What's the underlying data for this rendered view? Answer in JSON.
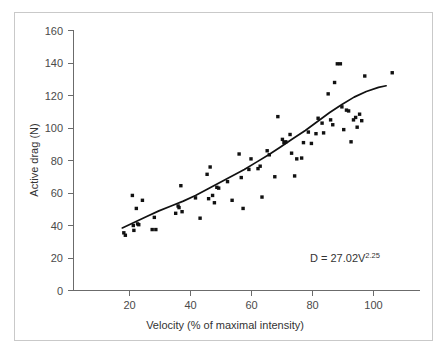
{
  "chart_data": {
    "type": "scatter",
    "title": "",
    "xlabel": "Velocity (% of maximal intensity)",
    "ylabel": "Active drag (N)",
    "xlim": [
      0,
      114
    ],
    "ylim": [
      0,
      160
    ],
    "xticks": [
      20,
      40,
      60,
      80,
      100
    ],
    "yticks": [
      0,
      20,
      40,
      60,
      80,
      100,
      120,
      140,
      160
    ],
    "grid": false,
    "legend": null,
    "annotations": [
      {
        "name": "regression-equation",
        "text_base": "D = 27.02V",
        "text_exponent": "2.25",
        "full_text": "D = 27.02V^2.25",
        "x": 82,
        "y": 20
      }
    ],
    "series": [
      {
        "name": "active-drag-measurements",
        "marker": "square",
        "color": "#111111",
        "points": [
          [
            16.5,
            35.5
          ],
          [
            17.0,
            34.0
          ],
          [
            19.3,
            58.5
          ],
          [
            19.6,
            40.0
          ],
          [
            19.8,
            37.0
          ],
          [
            20.6,
            50.5
          ],
          [
            21.0,
            41.0
          ],
          [
            21.4,
            40.5
          ],
          [
            22.6,
            55.5
          ],
          [
            25.8,
            37.5
          ],
          [
            26.5,
            45.0
          ],
          [
            27.0,
            37.5
          ],
          [
            33.5,
            47.5
          ],
          [
            34.3,
            52.0
          ],
          [
            34.6,
            51.0
          ],
          [
            35.2,
            64.5
          ],
          [
            35.6,
            48.5
          ],
          [
            40.0,
            57.0
          ],
          [
            41.5,
            44.5
          ],
          [
            43.8,
            71.5
          ],
          [
            44.3,
            56.5
          ],
          [
            44.8,
            76.0
          ],
          [
            45.6,
            58.5
          ],
          [
            46.2,
            54.0
          ],
          [
            47.0,
            63.5
          ],
          [
            47.6,
            63.0
          ],
          [
            50.5,
            67.0
          ],
          [
            52.0,
            55.5
          ],
          [
            54.3,
            84.0
          ],
          [
            55.0,
            69.5
          ],
          [
            55.6,
            50.5
          ],
          [
            57.5,
            74.5
          ],
          [
            58.2,
            81.0
          ],
          [
            60.5,
            75.0
          ],
          [
            61.2,
            76.5
          ],
          [
            61.8,
            57.5
          ],
          [
            63.5,
            86.0
          ],
          [
            64.2,
            83.5
          ],
          [
            66.0,
            70.0
          ],
          [
            67.0,
            107.0
          ],
          [
            68.5,
            93.0
          ],
          [
            69.0,
            91.0
          ],
          [
            69.6,
            91.5
          ],
          [
            71.0,
            96.0
          ],
          [
            71.5,
            84.5
          ],
          [
            72.5,
            70.5
          ],
          [
            73.2,
            81.0
          ],
          [
            74.8,
            81.5
          ],
          [
            75.4,
            91.0
          ],
          [
            77.0,
            97.5
          ],
          [
            78.0,
            90.5
          ],
          [
            79.5,
            96.5
          ],
          [
            80.2,
            106.0
          ],
          [
            81.5,
            103.0
          ],
          [
            82.0,
            97.0
          ],
          [
            83.5,
            121.0
          ],
          [
            84.3,
            105.0
          ],
          [
            85.0,
            102.0
          ],
          [
            85.6,
            128.0
          ],
          [
            86.5,
            139.5
          ],
          [
            87.5,
            139.5
          ],
          [
            88.0,
            113.0
          ],
          [
            88.6,
            99.0
          ],
          [
            89.5,
            111.0
          ],
          [
            90.2,
            110.5
          ],
          [
            91.0,
            91.5
          ],
          [
            91.8,
            105.0
          ],
          [
            92.5,
            106.5
          ],
          [
            93.0,
            100.5
          ],
          [
            93.8,
            108.5
          ],
          [
            94.5,
            104.5
          ],
          [
            95.5,
            132.0
          ],
          [
            104.5,
            134.0
          ]
        ]
      }
    ],
    "fit": {
      "name": "power-law-fit",
      "equation": "D = 27.02V^2.25",
      "color": "#111111",
      "points": [
        [
          16.0,
          38.5
        ],
        [
          20.0,
          42.0
        ],
        [
          24.0,
          45.5
        ],
        [
          28.0,
          49.0
        ],
        [
          32.0,
          52.0
        ],
        [
          36.0,
          55.0
        ],
        [
          40.0,
          58.5
        ],
        [
          44.0,
          62.5
        ],
        [
          48.0,
          66.5
        ],
        [
          52.0,
          70.5
        ],
        [
          56.0,
          74.5
        ],
        [
          60.0,
          79.0
        ],
        [
          64.0,
          83.5
        ],
        [
          68.0,
          88.5
        ],
        [
          72.0,
          93.5
        ],
        [
          76.0,
          98.5
        ],
        [
          80.0,
          104.0
        ],
        [
          84.0,
          109.5
        ],
        [
          88.0,
          114.5
        ],
        [
          92.0,
          119.0
        ],
        [
          96.0,
          122.5
        ],
        [
          100.0,
          125.0
        ],
        [
          102.5,
          126.0
        ]
      ]
    }
  },
  "axes": {
    "x": {
      "label": "Velocity (% of maximal intensity)",
      "tick_labels": [
        "20",
        "40",
        "60",
        "80",
        "100"
      ]
    },
    "y": {
      "label": "Active drag (N)",
      "tick_labels": [
        "0",
        "20",
        "40",
        "60",
        "80",
        "100",
        "120",
        "140",
        "160"
      ]
    }
  }
}
